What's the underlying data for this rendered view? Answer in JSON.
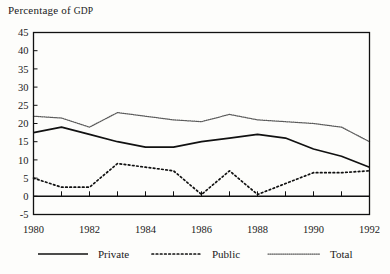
{
  "chart_data": {
    "type": "line",
    "title": "Percentage of GDP",
    "title_main": "Percentage of ",
    "title_smallcaps": "GDP",
    "xlabel": "",
    "ylabel": "",
    "x": [
      1980,
      1981,
      1982,
      1983,
      1984,
      1985,
      1986,
      1987,
      1988,
      1989,
      1990,
      1991,
      1992
    ],
    "xlim": [
      1980,
      1992
    ],
    "ylim": [
      -5,
      45
    ],
    "ytick_labels": [
      "45",
      "40",
      "35",
      "30",
      "25",
      "20",
      "15",
      "10",
      "5",
      "0",
      "-5"
    ],
    "ytick_values": [
      45,
      40,
      35,
      30,
      25,
      20,
      15,
      10,
      5,
      0,
      -5
    ],
    "xtick_labels": [
      "1980",
      "1982",
      "1984",
      "1986",
      "1988",
      "1990",
      "1992"
    ],
    "xtick_values": [
      1980,
      1982,
      1984,
      1986,
      1988,
      1990,
      1992
    ],
    "grid": false,
    "legend_position": "bottom",
    "series": [
      {
        "name": "Private",
        "style": "solid",
        "color": "#111111",
        "values": [
          17.5,
          19.0,
          17.0,
          15.0,
          13.5,
          13.5,
          15.0,
          16.0,
          17.0,
          16.0,
          13.0,
          11.0,
          8.0
        ]
      },
      {
        "name": "Public",
        "style": "dotted",
        "color": "#111111",
        "values": [
          5.0,
          2.5,
          2.5,
          9.0,
          8.0,
          7.0,
          0.5,
          7.0,
          0.5,
          3.5,
          6.5,
          6.5,
          7.0
        ]
      },
      {
        "name": "Total",
        "style": "fine-dotted",
        "color": "#5a5a5a",
        "values": [
          22.0,
          21.5,
          19.0,
          23.0,
          22.0,
          21.0,
          20.5,
          22.5,
          21.0,
          20.5,
          20.0,
          19.0,
          15.0
        ]
      }
    ]
  },
  "legend": {
    "items": [
      {
        "label": "Private",
        "style": "solid"
      },
      {
        "label": "Public",
        "style": "dotted"
      },
      {
        "label": "Total",
        "style": "fine-dotted"
      }
    ]
  }
}
